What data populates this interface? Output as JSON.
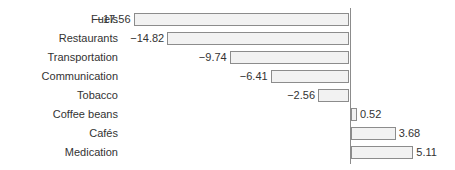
{
  "chart_data": {
    "type": "bar",
    "orientation": "horizontal",
    "title": "",
    "xlabel": "",
    "ylabel": "",
    "categories": [
      "Fuels",
      "Restaurants",
      "Transportation",
      "Communication",
      "Tobacco",
      "Coffee beans",
      "Cafés",
      "Medication"
    ],
    "values": [
      -17.56,
      -14.82,
      -9.74,
      -6.41,
      -2.56,
      0.52,
      3.68,
      5.11
    ],
    "value_labels": [
      "−17.56",
      "−14.82",
      "−9.74",
      "−6.41",
      "−2.56",
      "0.52",
      "3.68",
      "5.11"
    ],
    "xlim": [
      -17.56,
      5.11
    ],
    "grid": false,
    "legend": null,
    "zero_axis": true,
    "colors": {
      "bar_fill": "#f2f2f2",
      "bar_border": "#8c8c8c",
      "axis": "#8c8c8c",
      "text": "#333333"
    }
  }
}
